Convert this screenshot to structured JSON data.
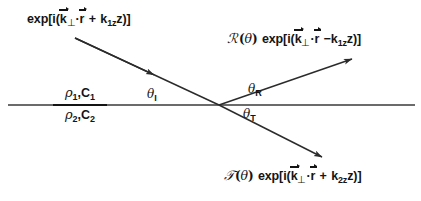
{
  "figure": {
    "name": "reflection-refraction-at-plane-interface",
    "background_color": "#ffffff",
    "line_color": "#2b2b2b",
    "text_color": "#141414"
  },
  "incident_wave": {
    "prefix": "exp[i(",
    "k_symbol": "k",
    "k_subscript": "⊥",
    "dot": "·",
    "r_symbol": "r",
    "operator": "+",
    "kz_symbol": "k",
    "kz_subscript": "1z",
    "z_symbol": "z",
    "suffix": ")]",
    "full_text": "exp[i(k⊥·r + k1zz)]"
  },
  "reflected_wave": {
    "coefficient": "ℛ",
    "argument_open": "(",
    "argument": "θ",
    "argument_close": ")",
    "prefix": "exp[i(",
    "k_symbol": "k",
    "k_subscript": "⊥",
    "dot": "·",
    "r_symbol": "r",
    "operator": "−",
    "kz_symbol": "k",
    "kz_subscript": "1z",
    "z_symbol": "z",
    "suffix": ")]",
    "full_text": "ℛ(θ) exp[i(k⊥·r − k1zz)]"
  },
  "transmitted_wave": {
    "coefficient": "𝒯",
    "argument_open": "(",
    "argument": "θ",
    "argument_close": ")",
    "prefix": "exp[i(",
    "k_symbol": "k",
    "k_subscript": "⊥",
    "dot": "·",
    "r_symbol": "r",
    "operator": "+",
    "kz_symbol": "k",
    "kz_subscript": "2z",
    "z_symbol": "z",
    "suffix": ")]",
    "full_text": "𝒯(θ) exp[i(k⊥·r + k2zz)]"
  },
  "media": {
    "upper": {
      "density": "ρ",
      "density_subscript": "1",
      "separator": ",",
      "speed": "C",
      "speed_subscript": "1",
      "full_text": "ρ1,C1"
    },
    "lower": {
      "density": "ρ",
      "density_subscript": "2",
      "separator": ",",
      "speed": "C",
      "speed_subscript": "2",
      "full_text": "ρ2,C2"
    }
  },
  "angles": {
    "incident": {
      "symbol": "θ",
      "subscript": "I",
      "full_text": "θI"
    },
    "reflected": {
      "symbol": "θ",
      "subscript": "R",
      "full_text": "θR"
    },
    "transmitted": {
      "symbol": "θ",
      "subscript": "T",
      "full_text": "θT"
    }
  },
  "geometry": {
    "interface": {
      "x1": 8,
      "y1": 105,
      "x2": 415,
      "y2": 105
    },
    "vertex": {
      "x": 219,
      "y": 105
    },
    "incident_ray": {
      "x1": 75,
      "y1": 38,
      "x2": 219,
      "y2": 105,
      "arrow_at": {
        "x": 152,
        "y": 74
      }
    },
    "reflected_ray": {
      "x1": 219,
      "y1": 105,
      "x2": 352,
      "y2": 59,
      "arrow_at": {
        "x": 352,
        "y": 59
      }
    },
    "transmitted_ray": {
      "x1": 219,
      "y1": 105,
      "x2": 322,
      "y2": 157,
      "arrow_at": {
        "x": 322,
        "y": 157
      }
    }
  }
}
